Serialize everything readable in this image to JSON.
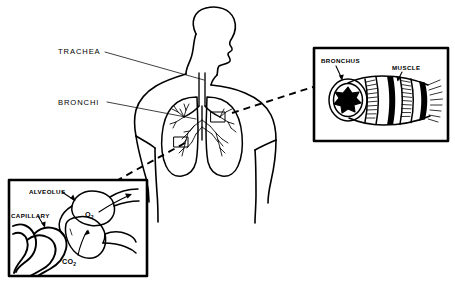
{
  "figure": {
    "background_color": "#ffffff",
    "ink_color": "#000000",
    "width": 455,
    "height": 281
  },
  "main_labels": [
    {
      "id": "trachea",
      "text": "TRACHEA"
    },
    {
      "id": "bronchi",
      "text": "BRONCHI"
    }
  ],
  "insets": [
    {
      "id": "bronchus-inset",
      "position": "top-right",
      "labels": [
        {
          "id": "bronchus",
          "text": "BRONCHUS"
        },
        {
          "id": "muscle",
          "text": "MUSCLE"
        }
      ]
    },
    {
      "id": "alveolus-inset",
      "position": "bottom-left",
      "labels": [
        {
          "id": "alveolus",
          "text": "ALVEOLUS"
        },
        {
          "id": "capillary",
          "text": "CAPILLARY"
        }
      ],
      "gas_labels": [
        {
          "id": "oxygen",
          "text": "O",
          "subscript": "2"
        },
        {
          "id": "carbon-dioxide",
          "text": "CO",
          "subscript": "2"
        }
      ]
    }
  ]
}
